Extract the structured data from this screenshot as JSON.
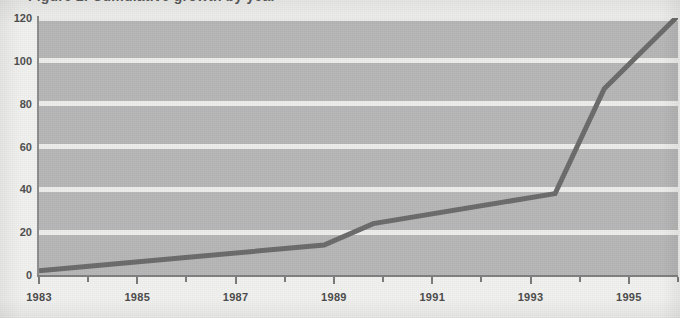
{
  "title": {
    "text": "Figure 2. Cumulative growth by year",
    "visible_fragment": true
  },
  "chart_data": {
    "type": "line",
    "title": "Figure 2. Cumulative growth by year",
    "xlabel": "",
    "ylabel": "",
    "xlim": [
      1983,
      1996
    ],
    "ylim": [
      0,
      120
    ],
    "grid": true,
    "legend": "none",
    "yticks": [
      0,
      20,
      40,
      60,
      80,
      100,
      120
    ],
    "ytick_labels": [
      "0",
      "20",
      "40",
      "60",
      "80",
      "100",
      "120"
    ],
    "xticks": [
      1983,
      1984,
      1985,
      1986,
      1987,
      1988,
      1989,
      1990,
      1991,
      1992,
      1993,
      1994,
      1995,
      1996
    ],
    "xtick_labels": [
      "1983",
      "",
      "1985",
      "",
      "1987",
      "",
      "1989",
      "",
      "1991",
      "",
      "1993",
      "",
      "1995",
      ""
    ],
    "x": [
      1983,
      1988.8,
      1989.8,
      1993.5,
      1994.5,
      1996
    ],
    "values": [
      2,
      14,
      24,
      38,
      87,
      121
    ],
    "series": [
      {
        "name": "Cumulative total",
        "color": "#6b6b6b",
        "x": [
          1983,
          1988.8,
          1989.8,
          1993.5,
          1994.5,
          1996
        ],
        "values": [
          2,
          14,
          24,
          38,
          87,
          121
        ]
      }
    ]
  },
  "style": {
    "page_background": "#f1f1ef",
    "plot_background": "#b6b6b6",
    "gridline_color": "#ededeb",
    "line_color": "#6b6b6b",
    "axis_color": "#7f7f7f",
    "text_color": "#4b4b4b"
  }
}
